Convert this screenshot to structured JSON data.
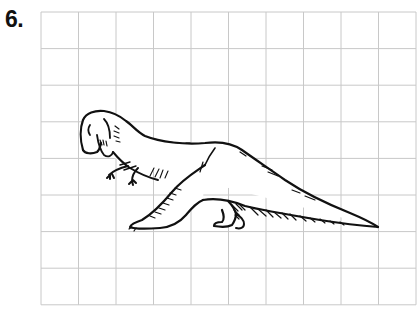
{
  "exercise": {
    "number_label": "6.",
    "subject": "dinosaur-drawing",
    "icon": "theropod-dinosaur-icon"
  },
  "grid": {
    "columns": 10,
    "rows": 8,
    "left": 41,
    "top": 12,
    "cell_width": 37.5,
    "cell_height": 36.6,
    "line_color": "#c8c8c8"
  },
  "colors": {
    "ink": "#111111",
    "background": "#ffffff"
  }
}
